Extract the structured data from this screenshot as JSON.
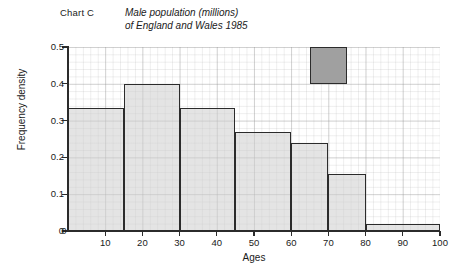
{
  "chart_label": "Chart C",
  "title_line1": "Male population (millions)",
  "title_line2": "of England and Wales 1985",
  "axis": {
    "xlabel": "Ages",
    "ylabel": "Frequency density"
  },
  "colors": {
    "bar_fill": "#cdcdcd",
    "bar_stroke": "#2b2b2b",
    "key_fill": "#a0a0a0",
    "grid": "#b4b4b4",
    "background": "#ffffff"
  },
  "chart_data": {
    "type": "bar",
    "title": "Male population (millions) of England and Wales 1985",
    "xlabel": "Ages",
    "ylabel": "Frequency density",
    "xlim": [
      0,
      100
    ],
    "ylim": [
      0,
      0.5
    ],
    "grid": true,
    "legend_position": "none",
    "xticks": [
      0,
      10,
      20,
      30,
      40,
      50,
      60,
      70,
      80,
      90,
      100
    ],
    "xtick_labels": [
      "0",
      "10",
      "20",
      "30",
      "40",
      "50",
      "60",
      "70",
      "80",
      "90",
      "100"
    ],
    "yticks": [
      0,
      0.1,
      0.2,
      0.3,
      0.4,
      0.5
    ],
    "ytick_labels": [
      "0",
      "0.1",
      "0.2",
      "0.3",
      "0.4",
      "0.5"
    ],
    "bin_edges": [
      0,
      15,
      30,
      45,
      60,
      70,
      80,
      100
    ],
    "categories": [
      "0-15",
      "15-30",
      "30-45",
      "45-60",
      "60-70",
      "70-80",
      "80-100"
    ],
    "values": [
      0.335,
      0.4,
      0.335,
      0.27,
      0.24,
      0.155,
      0.02
    ],
    "bars": [
      {
        "name": "bar-0-15",
        "x0": 0,
        "x1": 15,
        "height": 0.335
      },
      {
        "name": "bar-15-30",
        "x0": 15,
        "x1": 30,
        "height": 0.4
      },
      {
        "name": "bar-30-45",
        "x0": 30,
        "x1": 45,
        "height": 0.335
      },
      {
        "name": "bar-45-60",
        "x0": 45,
        "x1": 60,
        "height": 0.27
      },
      {
        "name": "bar-60-70",
        "x0": 60,
        "x1": 70,
        "height": 0.24
      },
      {
        "name": "bar-70-80",
        "x0": 70,
        "x1": 80,
        "height": 0.155
      },
      {
        "name": "bar-80-100",
        "x0": 80,
        "x1": 100,
        "height": 0.02
      }
    ],
    "key_square": {
      "x0": 65,
      "x1": 75,
      "y0": 0.4,
      "y1": 0.5,
      "label": ""
    },
    "annotations": []
  }
}
